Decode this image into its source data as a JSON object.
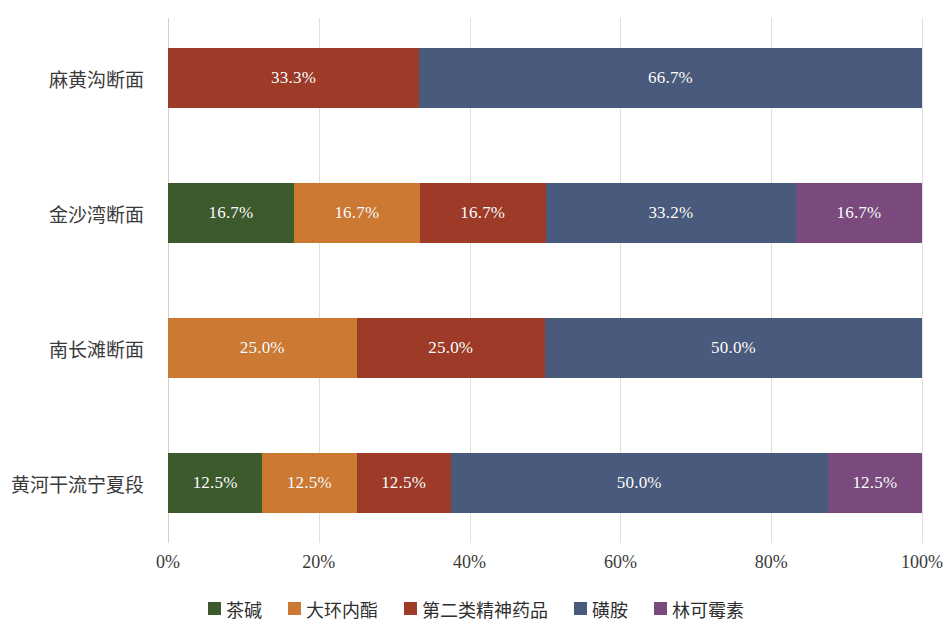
{
  "chart_data": {
    "type": "bar",
    "orientation": "horizontal",
    "stacked": "100%",
    "title": "",
    "xlabel": "",
    "ylabel": "",
    "xlim": [
      0,
      100
    ],
    "grid": true,
    "legend_position": "bottom",
    "categories": [
      "麻黄沟断面",
      "金沙湾断面",
      "南长滩断面",
      "黄河干流宁夏段"
    ],
    "xticks": [
      "0%",
      "20%",
      "40%",
      "60%",
      "80%",
      "100%"
    ],
    "xtick_values": [
      0,
      20,
      40,
      60,
      80,
      100
    ],
    "series": [
      {
        "name": "茶碱",
        "color": "#3D5A2D",
        "values": [
          0,
          16.7,
          0,
          12.5
        ],
        "labels": [
          "",
          "16.7%",
          "",
          "12.5%"
        ]
      },
      {
        "name": "大环内酯",
        "color": "#CC7A33",
        "values": [
          0,
          16.7,
          25.0,
          12.5
        ],
        "labels": [
          "",
          "16.7%",
          "25.0%",
          "12.5%"
        ]
      },
      {
        "name": "第二类精神药品",
        "color": "#9E3A28",
        "values": [
          33.3,
          16.7,
          25.0,
          12.5
        ],
        "labels": [
          "33.3%",
          "16.7%",
          "25.0%",
          "12.5%"
        ]
      },
      {
        "name": "磺胺",
        "color": "#4A5A7C",
        "values": [
          66.7,
          33.2,
          50.0,
          50.0
        ],
        "labels": [
          "66.7%",
          "33.2%",
          "50.0%",
          "50.0%"
        ]
      },
      {
        "name": "林可霉素",
        "color": "#7A4A7E",
        "values": [
          0,
          16.7,
          0,
          12.5
        ],
        "labels": [
          "",
          "16.7%",
          "",
          "12.5%"
        ]
      }
    ]
  },
  "axis": {
    "gridline_color": "#e2e0dd"
  }
}
